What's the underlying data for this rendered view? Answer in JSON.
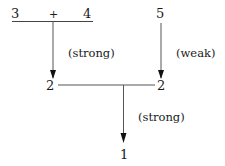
{
  "diagram": {
    "top": {
      "left_operand": "3",
      "operator": "+",
      "right_operand": "4",
      "right_value": "5"
    },
    "middle": {
      "left_value": "2",
      "right_value": "2"
    },
    "bottom": {
      "result": "1"
    },
    "edges": [
      {
        "from": "3 + 4",
        "to": "2",
        "label": "(strong)"
      },
      {
        "from": "5",
        "to": "2",
        "label": "(weak)"
      },
      {
        "from": "2 — 2",
        "to": "1",
        "label": "(strong)"
      }
    ],
    "colors": {
      "stroke": "#333333",
      "text": "#1a1a1a",
      "background": "#ffffff"
    }
  }
}
